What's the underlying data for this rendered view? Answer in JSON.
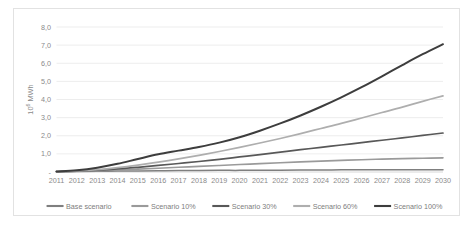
{
  "chart_data": {
    "type": "line",
    "title": "",
    "subtitle": "",
    "xlabel": "",
    "ylabel": "10⁶ MWh",
    "ylabel_parts": {
      "base": "10",
      "exponent": "6",
      "unit": " MWh"
    },
    "x": [
      2011,
      2012,
      2013,
      2014,
      2015,
      2016,
      2017,
      2018,
      2019,
      2020,
      2021,
      2022,
      2023,
      2024,
      2025,
      2026,
      2027,
      2028,
      2029,
      2030
    ],
    "categories": [
      "2011",
      "2012",
      "2013",
      "2014",
      "2015",
      "2016",
      "2017",
      "2018",
      "2019",
      "2020",
      "2021",
      "2022",
      "2023",
      "2024",
      "2025",
      "2026",
      "2027",
      "2028",
      "2029",
      "2030"
    ],
    "ylim": [
      0,
      8
    ],
    "ytick_values": [
      0,
      1,
      2,
      3,
      4,
      5,
      6,
      7,
      8
    ],
    "ytick_labels": [
      "-",
      "1,0",
      "2,0",
      "3,0",
      "4,0",
      "5,0",
      "6,0",
      "7,0",
      "8,0"
    ],
    "grid": true,
    "legend_position": "bottom",
    "series": [
      {
        "name": "Base scenario",
        "color": "#7f7f7f",
        "width": 1.5,
        "values": [
          0.02,
          0.03,
          0.04,
          0.05,
          0.06,
          0.07,
          0.08,
          0.08,
          0.09,
          0.09,
          0.1,
          0.1,
          0.11,
          0.11,
          0.12,
          0.12,
          0.12,
          0.13,
          0.13,
          0.13
        ]
      },
      {
        "name": "Scenario 10%",
        "color": "#9a9a9a",
        "width": 1.6,
        "values": [
          0.02,
          0.04,
          0.07,
          0.11,
          0.16,
          0.21,
          0.26,
          0.31,
          0.36,
          0.41,
          0.46,
          0.51,
          0.56,
          0.6,
          0.64,
          0.68,
          0.71,
          0.74,
          0.76,
          0.78
        ]
      },
      {
        "name": "Scenario 30%",
        "color": "#585858",
        "width": 1.7,
        "values": [
          0.02,
          0.05,
          0.1,
          0.17,
          0.26,
          0.36,
          0.47,
          0.58,
          0.7,
          0.83,
          0.96,
          1.1,
          1.23,
          1.36,
          1.49,
          1.62,
          1.75,
          1.88,
          2.02,
          2.15
        ]
      },
      {
        "name": "Scenario 60%",
        "color": "#aeaeae",
        "width": 1.7,
        "values": [
          0.02,
          0.06,
          0.13,
          0.24,
          0.38,
          0.54,
          0.72,
          0.92,
          1.13,
          1.36,
          1.6,
          1.85,
          2.12,
          2.4,
          2.68,
          2.98,
          3.28,
          3.58,
          3.9,
          4.2
        ]
      },
      {
        "name": "Scenario 100%",
        "color": "#3d3d3d",
        "width": 2.0,
        "values": [
          0.03,
          0.1,
          0.24,
          0.45,
          0.72,
          0.98,
          1.18,
          1.38,
          1.62,
          1.92,
          2.28,
          2.68,
          3.12,
          3.6,
          4.12,
          4.68,
          5.28,
          5.9,
          6.5,
          7.05
        ]
      }
    ]
  },
  "legend": {
    "items": [
      {
        "label": "Base scenario",
        "color": "#7f7f7f"
      },
      {
        "label": "Scenario 10%",
        "color": "#9a9a9a"
      },
      {
        "label": "Scenario 30%",
        "color": "#585858"
      },
      {
        "label": "Scenario 60%",
        "color": "#aeaeae"
      },
      {
        "label": "Scenario 100%",
        "color": "#3d3d3d"
      }
    ]
  }
}
